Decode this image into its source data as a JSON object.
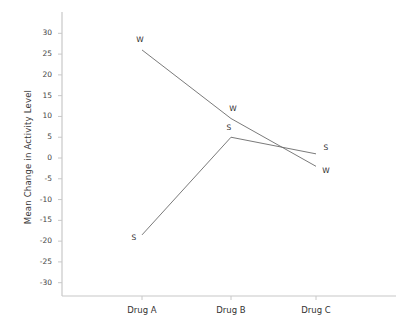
{
  "chart_data": {
    "type": "line",
    "title": "",
    "subtitle": "",
    "xlabel": "",
    "ylabel": "Mean Change in Activity Level",
    "categories": [
      "Drug A",
      "Drug B",
      "Drug C"
    ],
    "ylim": [
      -32,
      32
    ],
    "yticks": [
      30,
      25,
      20,
      15,
      10,
      5,
      0,
      -5,
      -10,
      -15,
      -20,
      -25,
      -30
    ],
    "ytick_labels": [
      "30",
      "25",
      "20",
      "15",
      "10",
      "5",
      "0",
      "-5",
      "-10",
      "-15",
      "-20",
      "-25",
      "-30"
    ],
    "grid": false,
    "legend_position": "none",
    "point_label_style": "inline-letter",
    "series": [
      {
        "name": "W",
        "label": "W",
        "values": [
          26,
          9.5,
          -2
        ],
        "point_labels": [
          "W",
          "W",
          "W"
        ]
      },
      {
        "name": "S",
        "label": "S",
        "values": [
          -18.5,
          5,
          1
        ],
        "point_labels": [
          "S",
          "S",
          "S"
        ]
      }
    ],
    "colors": {
      "line": "#6b6b6b",
      "axis": "#c8c8c8",
      "text": "#333333"
    }
  },
  "axis": {
    "y_title": "Mean Change in Activity Level"
  }
}
